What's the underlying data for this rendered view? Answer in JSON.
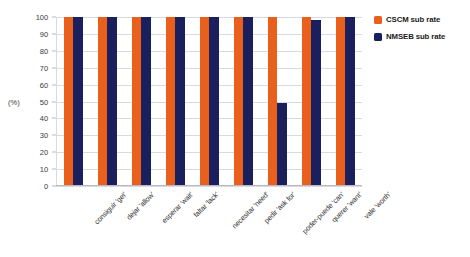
{
  "chart_data": {
    "type": "bar",
    "title": "",
    "xlabel": "",
    "ylabel": "(%)",
    "ylim": [
      0,
      100
    ],
    "yticks": [
      0,
      10,
      20,
      30,
      40,
      50,
      60,
      70,
      80,
      90,
      100
    ],
    "ytick_labels": [
      "0",
      "10",
      "20",
      "30",
      "40",
      "50",
      "60",
      "70",
      "80",
      "90",
      "100"
    ],
    "grid": true,
    "legend_position": "top-right",
    "categories": [
      "consiguir 'get'",
      "dejar 'allow'",
      "esperar 'wait'",
      "faltar 'lack'",
      "necesitar 'need'",
      "pedir 'ask for'",
      "poder-puede 'can'",
      "querer 'want'",
      "vale 'worth'"
    ],
    "series": [
      {
        "name": "CSCM sub rate",
        "color": "#E8601C",
        "values": [
          100,
          100,
          100,
          100,
          100,
          100,
          100,
          100,
          100
        ]
      },
      {
        "name": "NMSEB sub rate",
        "color": "#1A1F5E",
        "values": [
          100,
          100,
          100,
          100,
          100,
          100,
          49,
          98,
          100
        ]
      }
    ]
  },
  "colors": {
    "gridline": "#d9d9e2",
    "axis": "#b9b9c4",
    "background": "#ffffff",
    "tick_text": "#3a3a3a",
    "label_text": "#2f2f2f"
  }
}
